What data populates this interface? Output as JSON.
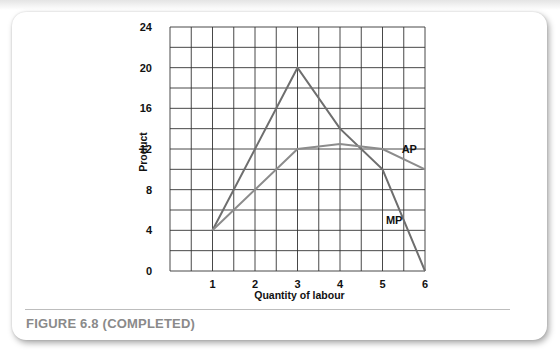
{
  "caption": "FIGURE 6.8 (COMPLETED)",
  "chart_data": {
    "type": "line",
    "title": "",
    "xlabel": "Quantity of labour",
    "ylabel": "Product",
    "xlim": [
      0,
      6
    ],
    "ylim": [
      0,
      24
    ],
    "x_ticks": [
      1,
      2,
      3,
      4,
      5,
      6
    ],
    "y_ticks": [
      0,
      4,
      8,
      12,
      16,
      20,
      24
    ],
    "grid": {
      "on": true,
      "x_step": 0.5,
      "y_step": 2
    },
    "series": [
      {
        "name": "MP",
        "x": [
          1,
          3,
          4,
          5,
          6
        ],
        "values": [
          4,
          20,
          14,
          10,
          0
        ],
        "color": "#6e6e6e"
      },
      {
        "name": "AP",
        "x": [
          1,
          3,
          4,
          5,
          6
        ],
        "values": [
          4,
          12,
          12.5,
          12,
          10
        ],
        "color": "#8c8c8c"
      }
    ],
    "legend": "inline labels: AP near (5.5, 11.5), MP near (5.2, 4.5)"
  }
}
